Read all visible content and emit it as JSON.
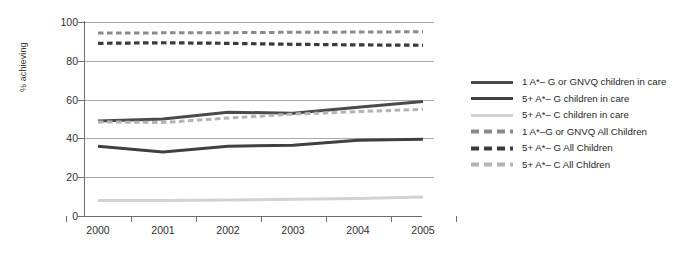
{
  "chart_data": {
    "type": "line",
    "title": "",
    "xlabel": "",
    "ylabel": "% achieving",
    "x": [
      "2000",
      "2001",
      "2002",
      "2003",
      "2004",
      "2005"
    ],
    "xlim": [
      "2000",
      "2005"
    ],
    "ylim": [
      0,
      100
    ],
    "yticks": [
      0,
      20,
      40,
      60,
      80,
      100
    ],
    "grid": "horizontal",
    "legend_position": "right",
    "series": [
      {
        "name": "1 A*– G or GNVQ children in care",
        "values": [
          49,
          50,
          53.5,
          53,
          56,
          59
        ],
        "color": "#4a4a4a",
        "style": "solid",
        "width": 3
      },
      {
        "name": "5+ A*– G children in care",
        "values": [
          36,
          33,
          36,
          36.5,
          39,
          39.5
        ],
        "color": "#404040",
        "style": "solid",
        "width": 3
      },
      {
        "name": "5+ A*– C children in care",
        "values": [
          8,
          8,
          8.3,
          8.6,
          9,
          9.8
        ],
        "color": "#d2d2d2",
        "style": "solid",
        "width": 3
      },
      {
        "name": "1 A*–G or GNVQ All Children",
        "values": [
          94.3,
          94.4,
          94.5,
          94.7,
          94.8,
          95
        ],
        "color": "#8a8a8a",
        "style": "dashed",
        "width": 3
      },
      {
        "name": "5+ A*– G All Children",
        "values": [
          89,
          89.3,
          89,
          88.5,
          88.2,
          88
        ],
        "color": "#3a3a3a",
        "style": "dashed",
        "width": 3.2
      },
      {
        "name": "5+ A*– C All Chldren",
        "values": [
          48.5,
          48.2,
          50.5,
          52.5,
          53.8,
          55
        ],
        "color": "#b4b4b4",
        "style": "dashed",
        "width": 3
      }
    ]
  },
  "axis": {
    "y_title": "% achieving",
    "y_tick_labels": [
      "100",
      "80",
      "60",
      "40",
      "20",
      "0"
    ],
    "x_tick_labels": [
      "2000",
      "2001",
      "2002",
      "2003",
      "2004",
      "2005"
    ]
  },
  "legend": {
    "items": [
      {
        "label": "1 A*– G or GNVQ children in care",
        "swatch": "solid-dark-line-swatch"
      },
      {
        "label": "5+ A*– G children in care",
        "swatch": "solid-dark-line-swatch"
      },
      {
        "label": "5+ A*– C children in care",
        "swatch": "solid-light-line-swatch"
      },
      {
        "label": "1 A*–G or GNVQ All Children",
        "swatch": "dashed-gray-line-swatch"
      },
      {
        "label": "5+ A*– G All Children",
        "swatch": "dashed-dark-line-swatch"
      },
      {
        "label": "5+ A*– C All Chldren",
        "swatch": "dashed-light-line-swatch"
      }
    ]
  }
}
